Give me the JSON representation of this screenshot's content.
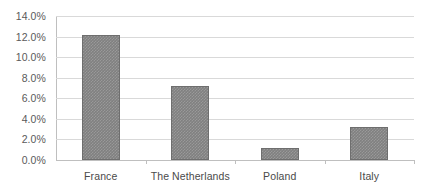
{
  "chart_data": {
    "type": "bar",
    "title": "",
    "subtitle": "",
    "xlabel": "",
    "ylabel": "",
    "categories": [
      "France",
      "The Netherlands",
      "Poland",
      "Italy"
    ],
    "values": [
      12.2,
      7.2,
      1.2,
      3.2
    ],
    "value_format": "percent",
    "ylim": [
      0.0,
      14.0
    ],
    "ytick_labels": [
      "0.0%",
      "2.0%",
      "4.0%",
      "6.0%",
      "8.0%",
      "10.0%",
      "12.0%",
      "14.0%"
    ],
    "ytick_values": [
      0.0,
      2.0,
      4.0,
      6.0,
      8.0,
      10.0,
      12.0,
      14.0
    ],
    "grid": true,
    "grid_axis": "y",
    "legend": false,
    "legend_position": "none",
    "series": [
      {
        "name": "",
        "values": [
          12.2,
          7.2,
          1.2,
          3.2
        ]
      }
    ],
    "colors": {
      "bar_fill": "#808080",
      "bar_border": "#6e6e6e",
      "gridline": "#d9d9d9",
      "axis_line": "#bfbfbf",
      "label_text": "#4a4a4a",
      "background": "#ffffff"
    }
  }
}
